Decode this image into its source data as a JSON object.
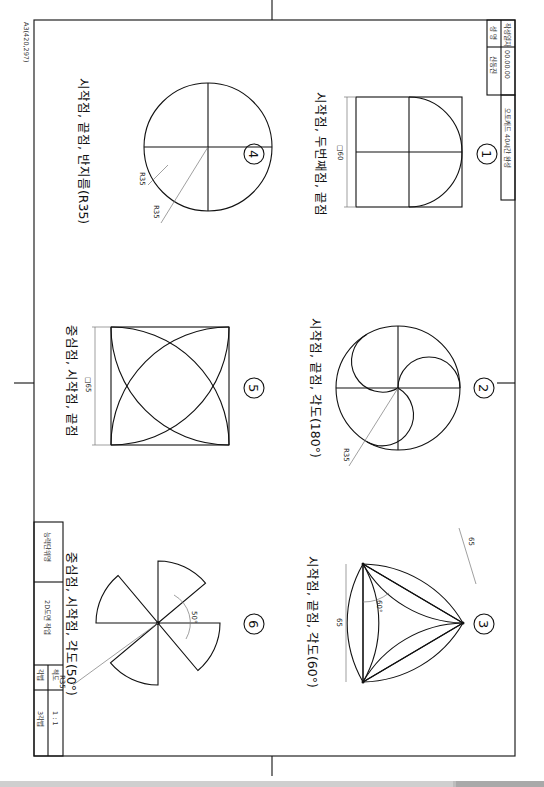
{
  "sheet": {
    "paper_label": "A3(420,297)"
  },
  "title_block_top": {
    "date_label": "작성일자",
    "date_value": "00.00.00",
    "name_label": "성 명",
    "name_value": "신동진",
    "course_title": "오토캐드 40시간 완성"
  },
  "title_block_bottom": {
    "unit_label": "능력단위명",
    "unit_value": "2D도면 작업",
    "scale_label": "척도",
    "scale_value": "1 : 1",
    "projection_label": "각법",
    "projection_value": "3각법"
  },
  "figures": [
    {
      "number": "1",
      "caption": "시작점, 두번째점, 끝점",
      "dims": [
        "□60"
      ]
    },
    {
      "number": "2",
      "caption": "시작점, 끝점, 각도(180°)",
      "dims": [
        "R35"
      ]
    },
    {
      "number": "3",
      "caption": "시작점, 끝점, 각도(60°)",
      "dims": [
        "65",
        "65",
        "60°"
      ]
    },
    {
      "number": "4",
      "caption": "시작점, 끝점, 반지름(R35)",
      "dims": [
        "R35",
        "R35"
      ]
    },
    {
      "number": "5",
      "caption": "중심점, 시작점, 끝점",
      "dims": [
        "□65"
      ]
    },
    {
      "number": "6",
      "caption": "중심점, 시작점, 각도(50°)",
      "dims": [
        "50°",
        "R35"
      ]
    }
  ],
  "colors": {
    "line": "#111111",
    "dimension_line": "#777777",
    "background": "#ffffff",
    "scrollbar": "#bdbdbd"
  }
}
